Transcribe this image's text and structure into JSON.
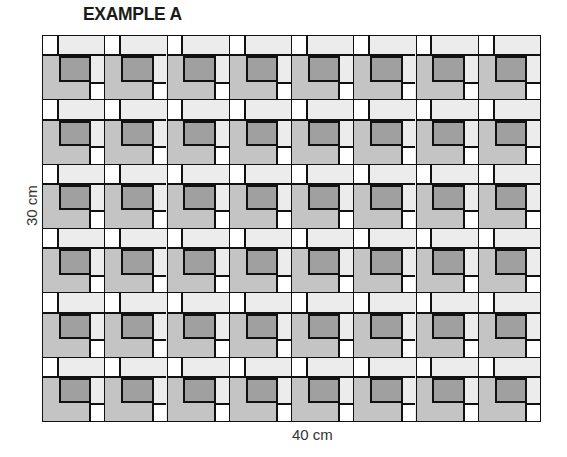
{
  "title": "EXAMPLE A",
  "dimensions": {
    "width_label": "40 cm",
    "height_label": "30 cm"
  },
  "pattern": {
    "columns": 8,
    "rows": 6,
    "block_description": "Nested square block: white corner square top-left, light grey L-strip along top and right, mid grey L along left and bottom, dark grey center square, white corner square bottom-right",
    "colors": {
      "outline": "#111111",
      "white_corner": "#ffffff",
      "light_strip": "#ececec",
      "mid_strip": "#c4c4c4",
      "dark_center": "#a0a0a0"
    }
  }
}
